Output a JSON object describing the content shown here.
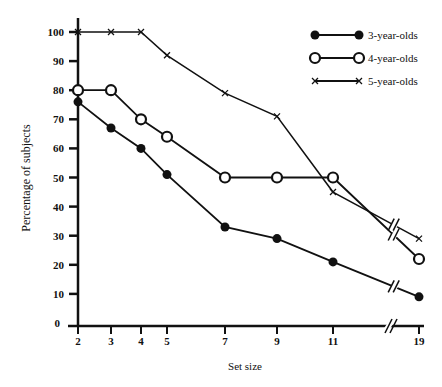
{
  "chart_data": {
    "type": "line",
    "title": "",
    "xlabel": "Set size",
    "ylabel": "Percentage of subjects",
    "x": [
      2,
      3,
      4,
      5,
      7,
      9,
      11,
      19
    ],
    "x_ticks": [
      "2",
      "3",
      "4",
      "5",
      "7",
      "9",
      "11",
      "19"
    ],
    "y_ticks": [
      "0",
      "10",
      "20",
      "30",
      "40",
      "50",
      "60",
      "70",
      "80",
      "90",
      "100"
    ],
    "ylim": [
      0,
      100
    ],
    "grid": false,
    "legend_position": "top-right",
    "axis_break": "between 11 and 19",
    "series": [
      {
        "name": "3-year-olds",
        "marker": "filled-circle",
        "values": [
          76,
          67,
          60,
          51,
          33,
          29,
          21,
          9
        ]
      },
      {
        "name": "4-year-olds",
        "marker": "open-circle",
        "values": [
          80,
          80,
          70,
          64,
          50,
          50,
          50,
          22
        ]
      },
      {
        "name": "5-year-olds",
        "marker": "x",
        "values": [
          100,
          100,
          100,
          92,
          79,
          71,
          45,
          29
        ]
      }
    ]
  }
}
